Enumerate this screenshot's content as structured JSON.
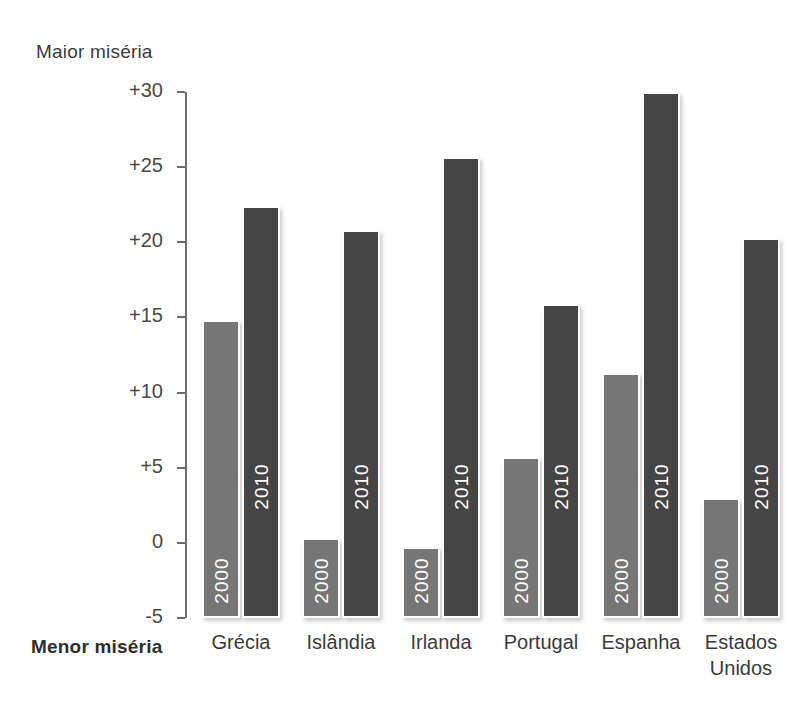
{
  "chart_data": {
    "type": "bar",
    "title": "",
    "subtitle": "",
    "xlabel": "",
    "ylabel": "",
    "axis_top_caption": "Maior miséria",
    "axis_bottom_caption": "Menor miséria",
    "categories": [
      "Grécia",
      "Islândia",
      "Irlanda",
      "Portugal",
      "Espanha",
      "Estados\nUnidos"
    ],
    "series": [
      {
        "name": "2000",
        "values": [
          14.8,
          0.3,
          -0.3,
          5.7,
          11.3,
          3.0
        ]
      },
      {
        "name": "2010",
        "values": [
          22.4,
          20.8,
          25.7,
          15.9,
          30.0,
          20.3
        ]
      }
    ],
    "ylim": [
      -5,
      30
    ],
    "yticks": [
      30,
      25,
      20,
      15,
      10,
      5,
      0,
      -5
    ],
    "ytick_labels": [
      "+30",
      "+25",
      "+20",
      "+15",
      "+10",
      "+5",
      "0",
      "-5"
    ],
    "grid": false,
    "legend": "none",
    "colors": {
      "series_2000": "#767676",
      "series_2010": "#454545",
      "axis": "#6d6d6d",
      "text": "#3b3b3b",
      "background": "#ffffff"
    }
  }
}
